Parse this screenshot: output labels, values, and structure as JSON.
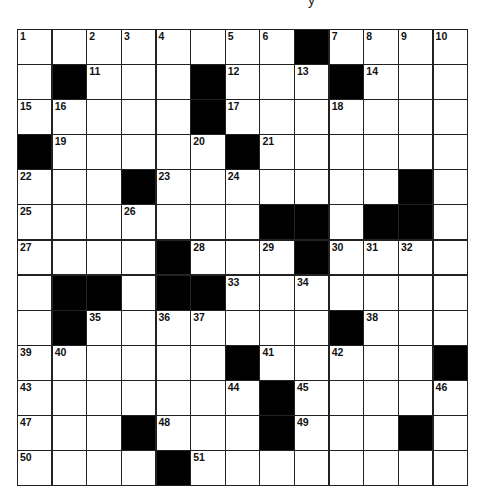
{
  "puzzle": {
    "title_fragment": "y",
    "rows": 13,
    "cols": 13,
    "grid": [
      [
        "1",
        "",
        "2",
        "3",
        "4",
        "",
        "5",
        "6",
        "#",
        "7",
        "8",
        "9",
        "10"
      ],
      [
        "",
        "#",
        "11",
        "",
        "",
        "#",
        "12",
        "",
        "13",
        "#",
        "14",
        "",
        ""
      ],
      [
        "15",
        "16",
        "",
        "",
        "",
        "#",
        "17",
        "",
        "",
        "18",
        "",
        "",
        ""
      ],
      [
        "#",
        "19",
        "",
        "",
        "",
        "20",
        "#",
        "21",
        "",
        "",
        "",
        "",
        ""
      ],
      [
        "22",
        "",
        "",
        "#",
        "23",
        "",
        "24",
        "",
        "",
        "",
        "",
        "#",
        ""
      ],
      [
        "25",
        "",
        "",
        "26",
        "",
        "",
        "",
        "#",
        "#",
        "",
        "#",
        "#",
        ""
      ],
      [
        "27",
        "",
        "",
        "",
        "#",
        "28",
        "",
        "29",
        "#",
        "30",
        "31",
        "32",
        ""
      ],
      [
        "",
        "#",
        "#",
        "",
        "#",
        "#",
        "33",
        "",
        "34",
        "",
        "",
        "",
        ""
      ],
      [
        "",
        "#",
        "35",
        "",
        "36",
        "37",
        "",
        "",
        "",
        "#",
        "38",
        "",
        ""
      ],
      [
        "39",
        "40",
        "",
        "",
        "",
        "",
        "#",
        "41",
        "",
        "42",
        "",
        "",
        "#"
      ],
      [
        "43",
        "",
        "",
        "",
        "",
        "",
        "44",
        "#",
        "45",
        "",
        "",
        "",
        "46"
      ],
      [
        "47",
        "",
        "",
        "#",
        "48",
        "",
        "",
        "#",
        "49",
        "",
        "",
        "#",
        ""
      ],
      [
        "50",
        "",
        "",
        "",
        "#",
        "51",
        "",
        "",
        "",
        "",
        "",
        "",
        ""
      ]
    ],
    "colors": {
      "black_cell": "#000000",
      "white_cell": "#ffffff",
      "grid_line": "#222222"
    }
  }
}
